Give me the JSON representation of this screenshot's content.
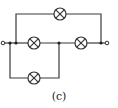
{
  "diagram": {
    "type": "circuit",
    "caption": "(c)",
    "colors": {
      "wire": "#3a3a3a",
      "background": "#ffffff"
    },
    "components": [
      {
        "id": "lamp-top",
        "kind": "lamp",
        "x": 60,
        "y": 14
      },
      {
        "id": "lamp-middle-left",
        "kind": "lamp",
        "x": 34,
        "y": 43
      },
      {
        "id": "lamp-middle-right",
        "kind": "lamp",
        "x": 81,
        "y": 43
      },
      {
        "id": "lamp-bottom",
        "kind": "lamp",
        "x": 34,
        "y": 78
      }
    ],
    "junctions": [
      {
        "x": 10,
        "y": 43
      },
      {
        "x": 16,
        "y": 43
      },
      {
        "x": 59,
        "y": 43
      },
      {
        "x": 101,
        "y": 43
      }
    ],
    "terminals": [
      {
        "id": "terminal-left",
        "x": 3,
        "y": 43
      },
      {
        "id": "terminal-right",
        "x": 107,
        "y": 43
      }
    ]
  }
}
